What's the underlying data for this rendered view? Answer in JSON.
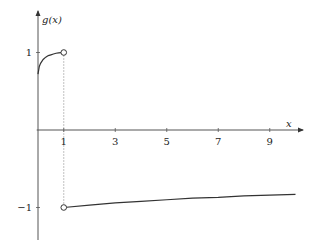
{
  "chart_data": {
    "type": "line",
    "title": "",
    "xlabel": "x",
    "ylabel": "g(x)",
    "xlim": [
      0,
      10.3
    ],
    "ylim": [
      -1.3,
      1.6
    ],
    "x_ticks": [
      1,
      3,
      5,
      7,
      9
    ],
    "x_tick_labels": [
      "1",
      "3",
      "5",
      "7",
      "9"
    ],
    "y_ticks": [
      1,
      -1
    ],
    "y_tick_labels": [
      "1",
      "−1"
    ],
    "grid": false,
    "series": [
      {
        "name": "g(x) for 0 < x < 1",
        "x": [
          0,
          0.05,
          0.1,
          0.2,
          0.3,
          0.4,
          0.5,
          0.6,
          0.7,
          0.8,
          0.9,
          1.0
        ],
        "y": [
          0.72,
          0.82,
          0.86,
          0.91,
          0.94,
          0.96,
          0.97,
          0.98,
          0.99,
          0.995,
          0.998,
          1.0
        ]
      },
      {
        "name": "g(x) for x > 1",
        "x": [
          1,
          2,
          3,
          4,
          5,
          6,
          7,
          8,
          9,
          10
        ],
        "y": [
          -1.0,
          -0.97,
          -0.94,
          -0.92,
          -0.9,
          -0.88,
          -0.87,
          -0.85,
          -0.84,
          -0.83
        ]
      }
    ],
    "open_points": [
      {
        "x": 1,
        "y": 1
      },
      {
        "x": 1,
        "y": -1
      }
    ],
    "guide_lines": [
      {
        "type": "vertical-dotted",
        "x": 1,
        "from_y": 1,
        "to_y": -1
      }
    ]
  }
}
